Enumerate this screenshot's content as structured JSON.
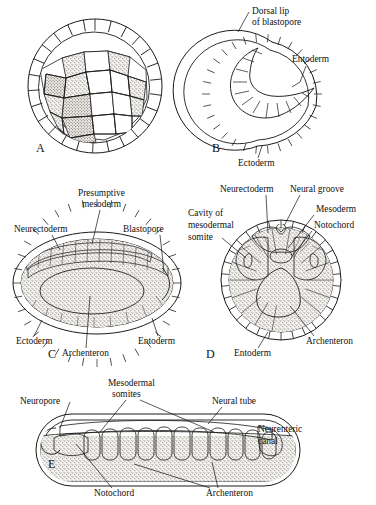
{
  "figure": {
    "background_color": "#ffffff",
    "ink_color": "#1a1a1a"
  },
  "panels": [
    {
      "letter": "A",
      "name": "blastula",
      "labels": []
    },
    {
      "letter": "B",
      "name": "gastrula-dorsal-lip",
      "labels": [
        {
          "id": "dorsal-lip",
          "text_line1": "Dorsal lip",
          "text_line2": "of blastopore"
        },
        {
          "id": "entoderm",
          "text_line1": "Entoderm"
        },
        {
          "id": "ectoderm",
          "text_line1": "Ectoderm"
        }
      ]
    },
    {
      "letter": "C",
      "name": "late-gastrula-sagittal",
      "labels": [
        {
          "id": "presumptive-mesoderm",
          "text_line1": "Presumptive",
          "text_line2": "mesoderm"
        },
        {
          "id": "neurectoderm",
          "text_line1": "Neurectoderm"
        },
        {
          "id": "blastopore",
          "text_line1": "Blastopore"
        },
        {
          "id": "ectoderm",
          "text_line1": "Ectoderm"
        },
        {
          "id": "archenteron",
          "text_line1": "Archenteron"
        },
        {
          "id": "entoderm",
          "text_line1": "Entoderm"
        }
      ]
    },
    {
      "letter": "D",
      "name": "neurula-transverse-section",
      "labels": [
        {
          "id": "neurectoderm",
          "text_line1": "Neurectoderm"
        },
        {
          "id": "neural-groove",
          "text_line1": "Neural groove"
        },
        {
          "id": "mesoderm",
          "text_line1": "Mesoderm"
        },
        {
          "id": "notochord",
          "text_line1": "Notochord"
        },
        {
          "id": "cavity-of-mesodermal-somite",
          "text_line1": "Cavity of",
          "text_line2": "mesodermal",
          "text_line3": "somite"
        },
        {
          "id": "entoderm",
          "text_line1": "Entoderm"
        },
        {
          "id": "archenteron",
          "text_line1": "Archenteron"
        }
      ]
    },
    {
      "letter": "E",
      "name": "tailbud-embryo-sagittal",
      "labels": [
        {
          "id": "neuropore",
          "text_line1": "Neuropore"
        },
        {
          "id": "mesodermal-somites",
          "text_line1": "Mesodermal",
          "text_line2": "somites"
        },
        {
          "id": "neural-tube",
          "text_line1": "Neural tube"
        },
        {
          "id": "neurenteric-canal",
          "text_line1": "Neurenteric",
          "text_line2": "canal"
        },
        {
          "id": "notochord",
          "text_line1": "Notochord"
        },
        {
          "id": "archenteron",
          "text_line1": "Archenteron"
        }
      ]
    }
  ],
  "tissue_shading": {
    "ectoderm_hatch": "#ffffff",
    "entoderm_stipple": "#d8d4cc",
    "mesoderm_gray": "#7d7a75",
    "neurectoderm_dark": "#3a3834",
    "cavity_white": "#ffffff",
    "yolk_stipple": "#cfcac1"
  },
  "somite_count_panel_e": 11
}
